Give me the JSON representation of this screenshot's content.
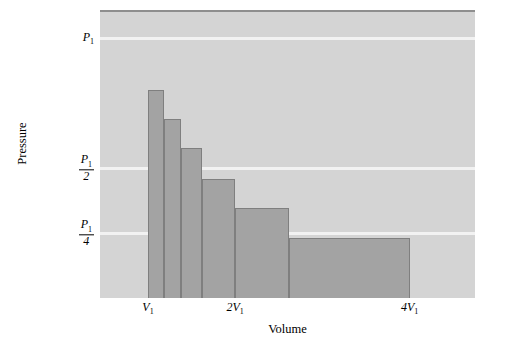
{
  "chart_data": {
    "type": "bar",
    "title": "",
    "xlabel": "Volume",
    "ylabel": "Pressure",
    "grid": true,
    "legend": "none",
    "xlim": [
      0.45,
      4.75
    ],
    "ylim": [
      0,
      1.1
    ],
    "x_unit": "V1",
    "y_unit": "P1",
    "x_ticks": [
      {
        "label": "V",
        "sub": "1",
        "value": 1
      },
      {
        "label": "2V",
        "sub": "1",
        "value": 2
      },
      {
        "label": "4V",
        "sub": "1",
        "value": 4
      }
    ],
    "y_ticks": [
      {
        "kind": "plain",
        "num": "P",
        "num_sub": "1",
        "den": "",
        "value": 1
      },
      {
        "kind": "fraction",
        "num": "P",
        "num_sub": "1",
        "den": "2",
        "value": 0.5
      },
      {
        "kind": "fraction",
        "num": "P",
        "num_sub": "1",
        "den": "4",
        "value": 0.25
      }
    ],
    "bars": [
      {
        "name": "step-1",
        "x_start": 1.0,
        "x_end": 1.18,
        "pressure": 0.8
      },
      {
        "name": "step-2",
        "x_start": 1.18,
        "x_end": 1.38,
        "pressure": 0.69
      },
      {
        "name": "step-3",
        "x_start": 1.38,
        "x_end": 1.62,
        "pressure": 0.578
      },
      {
        "name": "step-4",
        "x_start": 1.62,
        "x_end": 2.0,
        "pressure": 0.458
      },
      {
        "name": "step-5",
        "x_start": 2.0,
        "x_end": 2.62,
        "pressure": 0.348
      },
      {
        "name": "step-6",
        "x_start": 2.62,
        "x_end": 4.0,
        "pressure": 0.232
      }
    ],
    "colors": {
      "plot_background": "#d4d4d4",
      "bar_fill": "#a3a3a3",
      "bar_edge": "#7f7f7f",
      "gridline": "#f2f2f2",
      "text": "#000000",
      "page_background": "#ffffff"
    }
  }
}
